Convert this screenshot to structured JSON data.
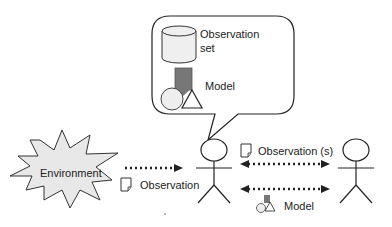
{
  "diagram": {
    "environment": {
      "label": "Environment",
      "fill": "#e8e8e8"
    },
    "speech_bubble": {
      "observation_set_label_line1": "Observation",
      "observation_set_label_line2": "set",
      "model_label": "Model"
    },
    "edges": [
      {
        "from": "environment",
        "to": "agent-1",
        "label": "Observation",
        "style": "dotted-arrow"
      },
      {
        "from": "agent-1",
        "to": "agent-2",
        "label": "Observation (s)",
        "style": "dotted-bidirectional"
      },
      {
        "from": "agent-1",
        "to": "agent-2",
        "label": "Model",
        "style": "dotted-bidirectional"
      }
    ],
    "agents": [
      {
        "id": "agent-1",
        "icon": "stick-figure"
      },
      {
        "id": "agent-2",
        "icon": "stick-figure"
      }
    ],
    "colors": {
      "line": "#222222",
      "shape_fill_light": "#eeeeee",
      "shape_fill_dark": "#777777"
    }
  }
}
